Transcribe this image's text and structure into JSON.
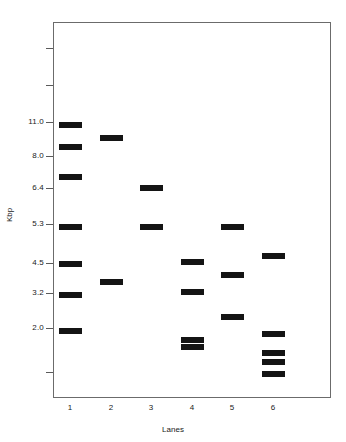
{
  "figure": {
    "type": "gel-electrophoresis-band-plot",
    "background_color": "#ffffff",
    "frame_color": "#6b6b6b",
    "band_color": "#141414"
  },
  "axes": {
    "y_title": "Kbp",
    "x_title": "Lanes",
    "y_tick_labels": [
      "11.0",
      "8.0",
      "6.4",
      "5.3",
      "4.5",
      "3.2",
      "2.0"
    ],
    "y_tick_values": [
      11.0,
      8.0,
      6.4,
      5.3,
      4.5,
      3.2,
      2.0
    ],
    "y_tick_pixel_y": [
      122,
      156,
      188,
      224,
      263,
      293,
      328
    ],
    "y_unlabeled_tick_pixel_y": [
      48,
      85,
      372
    ],
    "x_tick_labels": [
      "1",
      "2",
      "3",
      "4",
      "5",
      "6"
    ],
    "x_tick_pixel_x": [
      70,
      111,
      151,
      192,
      232,
      273
    ]
  },
  "chart_data": {
    "type": "scatter",
    "title": "",
    "xlabel": "Lanes",
    "ylabel": "Kbp",
    "categories": [
      "1",
      "2",
      "3",
      "4",
      "5",
      "6"
    ],
    "ytick_labels": [
      "11.0",
      "8.0",
      "6.4",
      "5.3",
      "4.5",
      "3.2",
      "2.0"
    ],
    "grid": false,
    "legend": "none",
    "lanes": [
      {
        "lane": 1,
        "x": 70,
        "band_count": 7,
        "bands_kbp": [
          11.0,
          9.3,
          6.4,
          5.3,
          4.5,
          3.3,
          2.0
        ],
        "bands_pixel_y": [
          122,
          144,
          174,
          224,
          261,
          292,
          328
        ]
      },
      {
        "lane": 2,
        "x": 111,
        "band_count": 2,
        "bands_kbp": [
          9.5,
          3.8
        ],
        "bands_pixel_y": [
          135,
          279
        ]
      },
      {
        "lane": 3,
        "x": 151,
        "band_count": 2,
        "bands_kbp": [
          6.7,
          5.3
        ],
        "bands_pixel_y": [
          185,
          224
        ]
      },
      {
        "lane": 4,
        "x": 192,
        "band_count": 4,
        "bands_kbp": [
          4.5,
          3.5,
          1.9,
          1.8
        ],
        "bands_pixel_y": [
          259,
          289,
          337,
          344
        ]
      },
      {
        "lane": 5,
        "x": 232,
        "band_count": 3,
        "bands_kbp": [
          5.3,
          4.1,
          2.4
        ],
        "bands_pixel_y": [
          224,
          272,
          314
        ]
      },
      {
        "lane": 6,
        "x": 273,
        "band_count": 4,
        "bands_kbp": [
          4.7,
          1.9,
          1.5,
          1.2
        ],
        "bands_pixel_y": [
          253,
          331,
          350,
          359,
          371
        ]
      }
    ]
  }
}
